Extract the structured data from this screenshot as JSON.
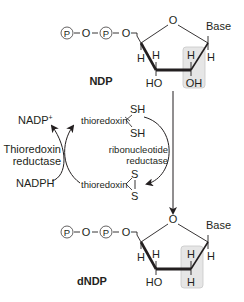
{
  "diagram": {
    "colors": {
      "line": "#231f20",
      "highlight_fill": "#e6e6e6",
      "highlight_stroke": "#c8c8c8",
      "background": "#ffffff"
    },
    "top_molecule": {
      "name": "NDP",
      "phosphate_chain": [
        "P",
        "O",
        "P",
        "O"
      ],
      "ring_oxygen": "O",
      "base_label": "Base",
      "substituents": {
        "c4_h": "H",
        "c3_h": "H",
        "c3_group": "HO",
        "c2_h": "H",
        "c2_group": "OH",
        "c1_h": "H"
      },
      "highlighted_group": "H / OH on C2'"
    },
    "bottom_molecule": {
      "name": "dNDP",
      "phosphate_chain": [
        "P",
        "O",
        "P",
        "O"
      ],
      "ring_oxygen": "O",
      "base_label": "Base",
      "substituents": {
        "c4_h": "H",
        "c3_h": "H",
        "c3_group": "HO",
        "c2_h": "H",
        "c2_group": "H",
        "c1_h": "H"
      },
      "highlighted_group": "H / H on C2'"
    },
    "cycle": {
      "nadp_plus": "NADP",
      "nadp_plus_sup": "+",
      "nadph": "NADPH",
      "thioredoxin_reductase_line1": "Thioredoxin",
      "thioredoxin_reductase_line2": "reductase",
      "thioredoxin_reduced": "thioredoxin",
      "sh_top": "SH",
      "sh_bottom": "SH",
      "thioredoxin_oxidized": "thioredoxin",
      "s_top": "S",
      "s_bottom": "S",
      "ribonucleotide_reductase_line1": "ribonucleotide",
      "ribonucleotide_reductase_line2": "reductase"
    }
  }
}
